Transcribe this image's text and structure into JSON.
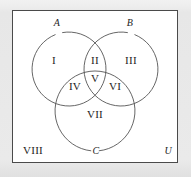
{
  "diagram": {
    "type": "venn-3-set",
    "stroke_color": "#555555",
    "frame_color": "#4a4a4a",
    "text_color": "#1d1d1d",
    "background_color": "#ffffff",
    "page_background_color": "#eaeaea",
    "frame": {
      "x": 12,
      "y": 10,
      "width": 166,
      "height": 153,
      "label": "U",
      "label_x": 168,
      "label_y": 151
    },
    "circles": [
      {
        "name": "A",
        "cx": 69,
        "cy": 69,
        "r": 37,
        "label": "A",
        "label_x": 57,
        "label_y": 23,
        "label_gap_deg": [
          248,
          260
        ]
      },
      {
        "name": "B",
        "cx": 121,
        "cy": 69,
        "r": 37,
        "label": "B",
        "label_x": 130,
        "label_y": 23,
        "label_gap_deg": [
          280,
          292
        ]
      },
      {
        "name": "C",
        "cx": 95,
        "cy": 111,
        "r": 40,
        "label": "C",
        "label_x": 96,
        "label_y": 151,
        "label_gap_deg": [
          84,
          96
        ]
      }
    ],
    "regions": [
      {
        "id": "I",
        "label": "I",
        "x": 54,
        "y": 60,
        "meaning": "A only"
      },
      {
        "id": "II",
        "label": "II",
        "x": 95,
        "y": 60,
        "meaning": "A and B only"
      },
      {
        "id": "III",
        "label": "III",
        "x": 131,
        "y": 60,
        "meaning": "B only"
      },
      {
        "id": "IV",
        "label": "IV",
        "x": 75,
        "y": 86,
        "meaning": "A and C only"
      },
      {
        "id": "V",
        "label": "V",
        "x": 95,
        "y": 78,
        "meaning": "A and B and C"
      },
      {
        "id": "VI",
        "label": "VI",
        "x": 115,
        "y": 86,
        "meaning": "B and C only"
      },
      {
        "id": "VII",
        "label": "VII",
        "x": 95,
        "y": 114,
        "meaning": "C only"
      },
      {
        "id": "VIII",
        "label": "VIII",
        "x": 33,
        "y": 150,
        "meaning": "outside all sets"
      }
    ]
  }
}
